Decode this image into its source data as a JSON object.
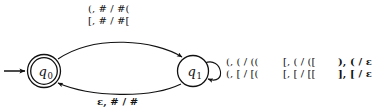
{
  "diagram": {
    "type": "pushdown-automaton-state-diagram",
    "states": [
      {
        "id": "q0",
        "label": "q",
        "subscript": "0",
        "accepting": true,
        "start": true,
        "cx": 44,
        "cy": 71
      },
      {
        "id": "q1",
        "label": "q",
        "subscript": "1",
        "accepting": false,
        "start": false,
        "cx": 193,
        "cy": 71
      }
    ],
    "transitions": [
      {
        "id": "t-q0-q1",
        "from": "q0",
        "to": "q1",
        "shape": "arc-above",
        "lines": [
          "(, # / #(",
          "[, # / #["
        ]
      },
      {
        "id": "t-q1-q0",
        "from": "q1",
        "to": "q0",
        "shape": "arc-below",
        "lines": [
          "ε, # / #"
        ]
      },
      {
        "id": "t-q1-self",
        "from": "q1",
        "to": "q1",
        "shape": "self-loop-right",
        "columns": [
          {
            "id": "col-1",
            "lines": [
              "(, ( / ((",
              "(, [ / [("
            ]
          },
          {
            "id": "col-2",
            "lines": [
              "[, ( / ([",
              "[, [ / [["
            ]
          },
          {
            "id": "col-3",
            "lines": [
              "), ( / ε",
              "], [ / ε"
            ]
          }
        ]
      }
    ],
    "start_arrow": {
      "id": "start-arrow",
      "target": "q0"
    },
    "colors": {
      "stroke": "#111111",
      "text": "#111111",
      "background": "#ffffff"
    }
  }
}
